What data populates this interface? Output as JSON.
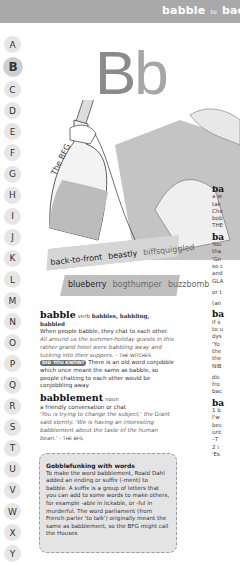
{
  "header": {
    "title_from": "babble",
    "title_to_word": "to",
    "title_end": "bac"
  },
  "alphabet": [
    "A",
    "B",
    "C",
    "D",
    "E",
    "F",
    "G",
    "H",
    "I",
    "J",
    "K",
    "L",
    "M",
    "N",
    "O",
    "P",
    "Q",
    "R",
    "S",
    "T",
    "U",
    "V",
    "W",
    "X",
    "Y"
  ],
  "active_letter": "B",
  "big_letter": {
    "upper": "B",
    "lower": "b"
  },
  "illustration": {
    "caption": "The BFG",
    "description": "Hand holding a bottle of frobscottle"
  },
  "word_strips": {
    "row1": [
      {
        "text": "back-to-front",
        "style": "dark"
      },
      {
        "text": "beastly",
        "style": "dark"
      },
      {
        "text": "biffsquiggled",
        "style": "light"
      }
    ],
    "row2": [
      {
        "text": "blueberry",
        "style": "dark"
      },
      {
        "text": "bogthumper",
        "style": "light"
      },
      {
        "text": "buzzbomb",
        "style": "light"
      }
    ]
  },
  "entries": {
    "babble": {
      "headword": "babble",
      "pos": "verb",
      "forms": "babbles, babbling, babbled",
      "definition": "When people babble, they chat to each other.",
      "example": "All around us the summer-holiday guests in this rather grand hotel were babbling away and tucking into their suppers.",
      "source": "– THE WITCHES",
      "dyk_label": "DID YOU KNOW?",
      "dyk_text": "There is an old word conjobble which once meant the same as babble, so people chatting to each other would be conjobbling away."
    },
    "babblement": {
      "headword": "babblement",
      "pos": "noun",
      "definition": "a friendly conversation or chat",
      "example": "'You is trying to change the subject,' the Giant said sternly. 'We is having an interesting babblement about the taste of the human bean.'",
      "source": "– THE BFG"
    }
  },
  "box": {
    "title": "Gobblefunking with words",
    "text": "To make the word babblement, Roald Dahl added an ending or suffix (-ment) to babble. A suffix is a group of letters that you can add to some words to make others, for example -able in lickable, or -ful in murderful. The word parliament (from French parler 'to talk') originally meant the same as babblement, so the BFG might call the Houses"
  },
  "right_column": {
    "lines": [
      "ba",
      "a w",
      "tak",
      "Che",
      "bob",
      "THE",
      "",
      "ba",
      "You",
      "tha",
      "'Gn",
      "so c",
      "and",
      "GLA",
      "",
      "or t",
      "",
      "(an",
      "",
      "ba",
      "If s",
      "to u",
      "dys",
      "'Yo",
      "the",
      "the",
      "NIB",
      "",
      "dic",
      "fro",
      "bac",
      "",
      "ba",
      "1 b",
      "I'w",
      "bec",
      "unt",
      "–T",
      "2 i",
      "'Es"
    ]
  }
}
